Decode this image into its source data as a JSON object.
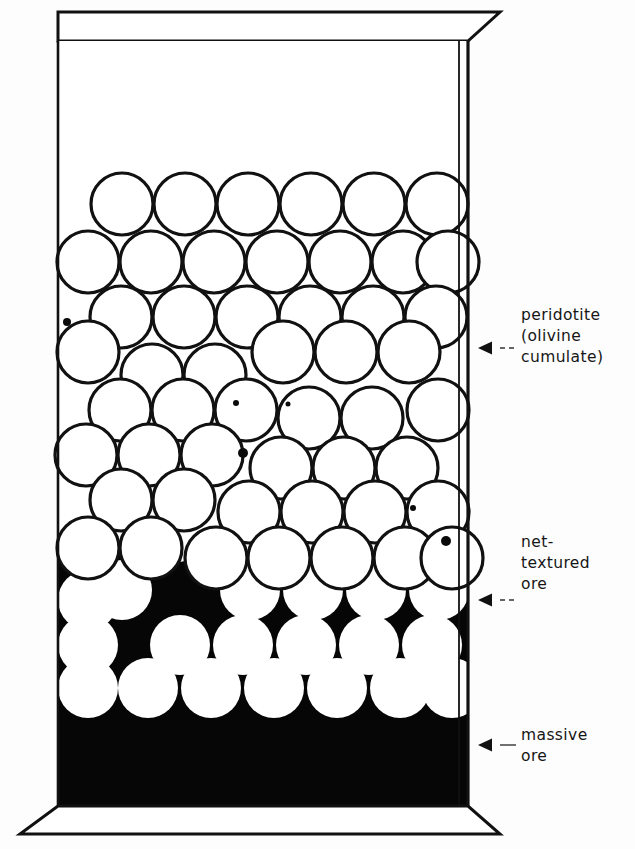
{
  "figure": {
    "type": "geological-section-diagram",
    "background_color": "#ffffff",
    "ink_color": "#111111",
    "matrix_color": "#050505",
    "olivine_fill": "#ffffff"
  },
  "container": {
    "name": "block-diagram-box",
    "top_lip": {
      "y_top": 12,
      "y_bottom": 41,
      "left": 58,
      "right": 468,
      "right_flare": 500
    },
    "body": {
      "left": 58,
      "right": 468,
      "y_top": 41,
      "y_bottom": 806
    },
    "base": {
      "y_top": 806,
      "y_bottom": 834,
      "left_flare": 20,
      "right_flare": 500
    }
  },
  "zones": [
    {
      "id": "barren-top",
      "name": "barren-upper-part",
      "label": "",
      "y_top": 41,
      "y_bottom": 175,
      "fill": "white",
      "description": "empty (spinifex / chilled upper) zone above the cumulate pile"
    },
    {
      "id": "peridotite",
      "name": "peridotite-zone",
      "label": "peridotite\n(olivine\ncumulate)",
      "label_lines": [
        "peridotite",
        "(olivine",
        "cumulate)"
      ],
      "y_top": 175,
      "y_bottom": 560,
      "fill": "white",
      "grain_style": "outlined-circles",
      "description": "close-packed white olivine grains with thin black outlines; minor interstitial sulphide blebs"
    },
    {
      "id": "net-textured",
      "name": "net-textured-ore-zone",
      "label": "net-\ntextured\nore",
      "label_lines": [
        "net-",
        "textured",
        "ore"
      ],
      "y_top": 560,
      "y_bottom": 716,
      "fill": "black-matrix-white-grains",
      "grain_style": "white-circles-in-black-matrix",
      "description": "sulphide forms a continuous black net between white olivine grains"
    },
    {
      "id": "massive",
      "name": "massive-ore-zone",
      "label": "massive\nore",
      "label_lines": [
        "massive",
        "ore"
      ],
      "y_top": 716,
      "y_bottom": 806,
      "fill": "solid-black",
      "grain_style": "none",
      "description": "solid sulphide, no silicate grains"
    }
  ],
  "annotations": [
    {
      "id": "ann-peridotite",
      "name": "annotation-peridotite",
      "arrow_y": 348,
      "leader": "dashed",
      "arrow": "left-triangle"
    },
    {
      "id": "ann-net",
      "name": "annotation-net-textured",
      "arrow_y": 600,
      "leader": "dashed",
      "arrow": "left-triangle"
    },
    {
      "id": "ann-massive",
      "name": "annotation-massive",
      "arrow_y": 745,
      "leader": "solid",
      "arrow": "left-triangle"
    }
  ],
  "labels": {
    "peridotite": "peridotite\n(olivine\ncumulate)",
    "net_textured": "net-\ntextured\nore",
    "massive": "massive\nore"
  },
  "grains": {
    "diameter_px": 62,
    "outline_width_px": 3.2,
    "peridotite_rows": [
      {
        "cy": 204,
        "r": 31,
        "cxs": [
          122,
          185,
          248,
          311,
          374,
          437
        ]
      },
      {
        "cy": 262,
        "r": 31,
        "cxs": [
          88,
          151,
          214,
          277,
          340,
          403,
          448
        ]
      },
      {
        "cy": 317,
        "r": 31,
        "cxs": [
          121,
          184,
          247,
          310,
          373,
          436
        ]
      },
      {
        "cy": 352,
        "r": 31,
        "cxs": [
          88,
          283,
          346,
          409
        ]
      },
      {
        "cy": 375,
        "r": 31,
        "cxs": [
          152,
          215
        ]
      },
      {
        "cy": 410,
        "r": 31,
        "cxs": [
          120,
          183,
          246,
          438
        ]
      },
      {
        "cy": 418,
        "r": 31,
        "cxs": [
          309,
          372
        ]
      },
      {
        "cy": 455,
        "r": 31,
        "cxs": [
          86,
          149,
          212
        ]
      },
      {
        "cy": 468,
        "r": 31,
        "cxs": [
          281,
          344,
          407
        ]
      },
      {
        "cy": 500,
        "r": 31,
        "cxs": [
          121,
          184
        ]
      },
      {
        "cy": 512,
        "r": 31,
        "cxs": [
          249,
          312,
          375,
          438
        ]
      },
      {
        "cy": 548,
        "r": 31,
        "cxs": [
          88,
          151
        ]
      },
      {
        "cy": 558,
        "r": 31,
        "cxs": [
          216,
          279,
          342,
          405,
          452
        ]
      }
    ],
    "net_rows": [
      {
        "cy": 590,
        "r": 30,
        "cxs": [
          122,
          250,
          313,
          376,
          439
        ]
      },
      {
        "cy": 600,
        "r": 30,
        "cxs": [
          88
        ]
      },
      {
        "cy": 645,
        "r": 30,
        "cxs": [
          88,
          180,
          243,
          306,
          369,
          432
        ]
      },
      {
        "cy": 688,
        "r": 30,
        "cxs": [
          88,
          148,
          211,
          274,
          337,
          400,
          452
        ]
      }
    ],
    "sulphide_blebs": [
      {
        "cx": 67,
        "cy": 322,
        "r": 4.0
      },
      {
        "cx": 243,
        "cy": 453,
        "r": 5.0
      },
      {
        "cx": 413,
        "cy": 508,
        "r": 3.0
      },
      {
        "cx": 446,
        "cy": 541,
        "r": 5.0
      },
      {
        "cx": 236,
        "cy": 403,
        "r": 3.0
      },
      {
        "cx": 288,
        "cy": 404,
        "r": 2.5
      },
      {
        "cx": 406,
        "cy": 508,
        "r": 2.0
      }
    ]
  }
}
